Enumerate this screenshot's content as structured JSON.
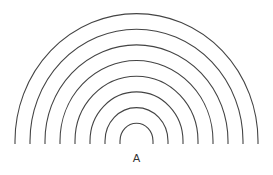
{
  "diagram": {
    "source_label": "A",
    "stroke_color": "#444444",
    "background": "#ffffff",
    "center_x": 136.5,
    "base_y": 144,
    "arc_count": 8,
    "radii": [
      16.5,
      31.5,
      46.5,
      61.5,
      76.5,
      91.5,
      106.5,
      121.5
    ]
  }
}
